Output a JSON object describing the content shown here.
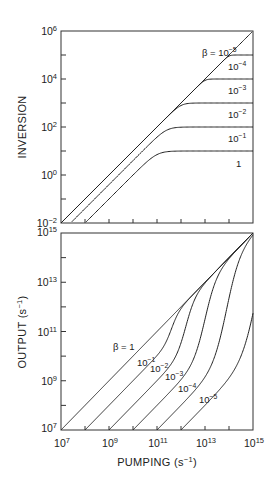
{
  "chart_data": [
    {
      "type": "line",
      "panel": "top",
      "title": "",
      "xlabel": "",
      "ylabel": "INVERSION",
      "xscale": "log",
      "yscale": "log",
      "xlim_exp": [
        7,
        15
      ],
      "ylim_exp": [
        -2,
        6
      ],
      "yticks": [
        {
          "base": "10",
          "exp": "6"
        },
        {
          "base": "10",
          "exp": "4"
        },
        {
          "base": "10",
          "exp": "2"
        },
        {
          "base": "10",
          "exp": "0"
        },
        {
          "base": "10",
          "exp": "−2"
        }
      ],
      "grid": false,
      "series": [
        {
          "name": "β = 10⁻⁵",
          "label_base": "β = 10",
          "label_exp": "−5",
          "beta_exp": -5,
          "x_exp": [
            7,
            15
          ],
          "y_exp": [
            -2,
            6
          ]
        },
        {
          "name": "10⁻⁴",
          "label_base": "10",
          "label_exp": "−4",
          "beta_exp": -4,
          "x_exp": [
            7,
            14,
            15
          ],
          "y_exp": [
            -2,
            5,
            5
          ]
        },
        {
          "name": "10⁻³",
          "label_base": "10",
          "label_exp": "−3",
          "beta_exp": -3,
          "x_exp": [
            7,
            13,
            15
          ],
          "y_exp": [
            -2,
            4,
            4
          ]
        },
        {
          "name": "10⁻²",
          "label_base": "10",
          "label_exp": "−2",
          "beta_exp": -2,
          "x_exp": [
            7,
            12,
            15
          ],
          "y_exp": [
            -2,
            3,
            3
          ]
        },
        {
          "name": "10⁻¹",
          "label_base": "10",
          "label_exp": "−1",
          "beta_exp": -1,
          "x_exp": [
            7.3,
            11.5,
            15
          ],
          "y_exp": [
            -2,
            2,
            2
          ]
        },
        {
          "name": "1",
          "label_base": "1",
          "label_exp": "",
          "beta_exp": 0,
          "x_exp": [
            8,
            11.5,
            15
          ],
          "y_exp": [
            -2,
            1,
            1
          ]
        }
      ]
    },
    {
      "type": "line",
      "panel": "bottom",
      "title": "",
      "xlabel": "PUMPING (s⁻¹)",
      "xlabel_base": "PUMPING (s",
      "xlabel_exp": "−1",
      "xlabel_tail": ")",
      "ylabel": "OUTPUT (s⁻¹)",
      "ylabel_base": "OUTPUT (s",
      "ylabel_exp": "−1",
      "ylabel_tail": ")",
      "xscale": "log",
      "yscale": "log",
      "xlim_exp": [
        7,
        15
      ],
      "ylim_exp": [
        7,
        15
      ],
      "xticks": [
        {
          "base": "10",
          "exp": "7"
        },
        {
          "base": "10",
          "exp": "9"
        },
        {
          "base": "10",
          "exp": "11"
        },
        {
          "base": "10",
          "exp": "13"
        },
        {
          "base": "10",
          "exp": "15"
        }
      ],
      "yticks": [
        {
          "base": "10",
          "exp": "15"
        },
        {
          "base": "10",
          "exp": "13"
        },
        {
          "base": "10",
          "exp": "11"
        },
        {
          "base": "10",
          "exp": "9"
        },
        {
          "base": "10",
          "exp": "7"
        }
      ],
      "grid": false,
      "series": [
        {
          "name": "β = 1",
          "label_base": "β = 1",
          "label_exp": "",
          "beta_exp": 0
        },
        {
          "name": "10⁻¹",
          "label_base": "10",
          "label_exp": "−1",
          "beta_exp": -1
        },
        {
          "name": "10⁻²",
          "label_base": "10",
          "label_exp": "−2",
          "beta_exp": -2
        },
        {
          "name": "10⁻³",
          "label_base": "10",
          "label_exp": "−3",
          "beta_exp": -3
        },
        {
          "name": "10⁻⁴",
          "label_base": "10",
          "label_exp": "−4",
          "beta_exp": -4
        },
        {
          "name": "10⁻⁵",
          "label_base": "10",
          "label_exp": "−5",
          "beta_exp": -5
        }
      ]
    }
  ]
}
